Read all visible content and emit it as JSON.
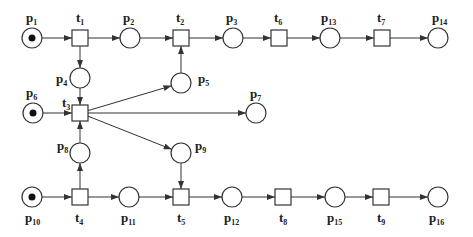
{
  "diagram": {
    "type": "petri-net",
    "places": [
      {
        "id": "p1",
        "label": "p",
        "sub": "1",
        "x": 32,
        "y": 38,
        "tokens": 1,
        "lx": 26,
        "ly": 22
      },
      {
        "id": "p2",
        "label": "p",
        "sub": "2",
        "x": 130,
        "y": 38,
        "tokens": 0,
        "lx": 123,
        "ly": 22
      },
      {
        "id": "p3",
        "label": "p",
        "sub": "3",
        "x": 233,
        "y": 38,
        "tokens": 0,
        "lx": 226,
        "ly": 22
      },
      {
        "id": "p4",
        "label": "p",
        "sub": "4",
        "x": 80,
        "y": 78,
        "tokens": 0,
        "lx": 56,
        "ly": 83
      },
      {
        "id": "p5",
        "label": "p",
        "sub": "5",
        "x": 181,
        "y": 83,
        "tokens": 0,
        "lx": 198,
        "ly": 83
      },
      {
        "id": "p6",
        "label": "p",
        "sub": "6",
        "x": 33,
        "y": 113,
        "tokens": 1,
        "lx": 26,
        "ly": 97
      },
      {
        "id": "p7",
        "label": "p",
        "sub": "7",
        "x": 256,
        "y": 113,
        "tokens": 0,
        "lx": 250,
        "ly": 98
      },
      {
        "id": "p8",
        "label": "p",
        "sub": "8",
        "x": 80,
        "y": 153,
        "tokens": 0,
        "lx": 57,
        "ly": 150
      },
      {
        "id": "p9",
        "label": "p",
        "sub": "9",
        "x": 181,
        "y": 153,
        "tokens": 0,
        "lx": 195,
        "ly": 150
      },
      {
        "id": "p10",
        "label": "p",
        "sub": "10",
        "x": 32,
        "y": 197,
        "tokens": 1,
        "lx": 25,
        "ly": 222
      },
      {
        "id": "p11",
        "label": "p",
        "sub": "11",
        "x": 129,
        "y": 197,
        "tokens": 0,
        "lx": 121,
        "ly": 222
      },
      {
        "id": "p12",
        "label": "p",
        "sub": "12",
        "x": 232,
        "y": 197,
        "tokens": 0,
        "lx": 224,
        "ly": 222
      },
      {
        "id": "p13",
        "label": "p",
        "sub": "13",
        "x": 330,
        "y": 38,
        "tokens": 0,
        "lx": 321,
        "ly": 22
      },
      {
        "id": "p14",
        "label": "p",
        "sub": "14",
        "x": 438,
        "y": 38,
        "tokens": 0,
        "lx": 432,
        "ly": 22
      },
      {
        "id": "p15",
        "label": "p",
        "sub": "15",
        "x": 335,
        "y": 197,
        "tokens": 0,
        "lx": 327,
        "ly": 222
      },
      {
        "id": "p16",
        "label": "p",
        "sub": "16",
        "x": 438,
        "y": 197,
        "tokens": 0,
        "lx": 429,
        "ly": 222
      }
    ],
    "transitions": [
      {
        "id": "t1",
        "label": "t",
        "sub": "1",
        "x": 80,
        "y": 38,
        "lx": 76,
        "ly": 22
      },
      {
        "id": "t2",
        "label": "t",
        "sub": "2",
        "x": 181,
        "y": 38,
        "lx": 176,
        "ly": 22
      },
      {
        "id": "t3",
        "label": "t",
        "sub": "3",
        "x": 80,
        "y": 113,
        "lx": 62,
        "ly": 107
      },
      {
        "id": "t4",
        "label": "t",
        "sub": "4",
        "x": 80,
        "y": 197,
        "lx": 75,
        "ly": 222
      },
      {
        "id": "t5",
        "label": "t",
        "sub": "5",
        "x": 181,
        "y": 197,
        "lx": 177,
        "ly": 222
      },
      {
        "id": "t6",
        "label": "t",
        "sub": "6",
        "x": 279,
        "y": 38,
        "lx": 274,
        "ly": 22
      },
      {
        "id": "t7",
        "label": "t",
        "sub": "7",
        "x": 382,
        "y": 38,
        "lx": 377,
        "ly": 22
      },
      {
        "id": "t8",
        "label": "t",
        "sub": "8",
        "x": 283,
        "y": 197,
        "lx": 279,
        "ly": 222
      },
      {
        "id": "t9",
        "label": "t",
        "sub": "9",
        "x": 381,
        "y": 197,
        "lx": 377,
        "ly": 222
      }
    ],
    "arcs": [
      [
        "p1",
        "t1"
      ],
      [
        "t1",
        "p2"
      ],
      [
        "p2",
        "t2"
      ],
      [
        "t2",
        "p3"
      ],
      [
        "p3",
        "t6"
      ],
      [
        "t6",
        "p13"
      ],
      [
        "p13",
        "t7"
      ],
      [
        "t7",
        "p14"
      ],
      [
        "t1",
        "p4"
      ],
      [
        "p4",
        "t3"
      ],
      [
        "p5",
        "t2"
      ],
      [
        "p6",
        "t3"
      ],
      [
        "t3",
        "p5"
      ],
      [
        "t3",
        "p7"
      ],
      [
        "t3",
        "p9"
      ],
      [
        "p8",
        "t3"
      ],
      [
        "t4",
        "p8"
      ],
      [
        "p9",
        "t5"
      ],
      [
        "p10",
        "t4"
      ],
      [
        "t4",
        "p11"
      ],
      [
        "p11",
        "t5"
      ],
      [
        "t5",
        "p12"
      ],
      [
        "p12",
        "t8"
      ],
      [
        "t8",
        "p15"
      ],
      [
        "p15",
        "t9"
      ],
      [
        "t9",
        "p16"
      ]
    ]
  }
}
